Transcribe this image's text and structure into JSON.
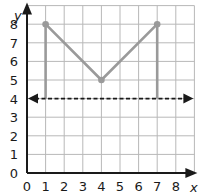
{
  "chart_data": {
    "type": "line",
    "title": "",
    "xlabel": "x",
    "ylabel": "y",
    "xlim": [
      0,
      9
    ],
    "ylim": [
      0,
      9
    ],
    "x_ticks": [
      0,
      1,
      2,
      3,
      4,
      5,
      6,
      7,
      8
    ],
    "y_ticks": [
      0,
      1,
      2,
      3,
      4,
      5,
      6,
      7,
      8
    ],
    "grid": true,
    "series": [
      {
        "name": "V-shaped graph",
        "style": "solid",
        "color": "#9a9a9a",
        "points": [
          [
            1,
            8
          ],
          [
            4,
            5
          ],
          [
            7,
            8
          ]
        ],
        "markers": true
      },
      {
        "name": "left vertical segment",
        "style": "solid",
        "color": "#9a9a9a",
        "points": [
          [
            1,
            4
          ],
          [
            1,
            8
          ]
        ]
      },
      {
        "name": "right vertical segment",
        "style": "solid",
        "color": "#9a9a9a",
        "points": [
          [
            7,
            4
          ],
          [
            7,
            8
          ]
        ]
      },
      {
        "name": "line y = 4",
        "style": "dashed",
        "color": "#1a1a1a",
        "equation": "y = 4",
        "arrows": "both"
      }
    ]
  },
  "labels": {
    "x_axis": "x",
    "y_axis": "y",
    "x_ticks": [
      "0",
      "1",
      "2",
      "3",
      "4",
      "5",
      "6",
      "7",
      "8"
    ],
    "y_ticks": [
      "0",
      "1",
      "2",
      "3",
      "4",
      "5",
      "6",
      "7",
      "8"
    ]
  },
  "colors": {
    "grid": "#b8b8b8",
    "axis": "#1a1a1a",
    "graph": "#9a9a9a",
    "dashed_line": "#1a1a1a"
  }
}
